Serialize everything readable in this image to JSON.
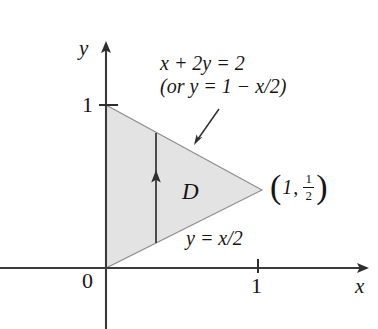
{
  "figure": {
    "type": "math-region-diagram",
    "background_color": "#ffffff",
    "axis_color": "#3a3a3a",
    "region_fill_color": "#e3e3e3",
    "region_stroke_color": "#8a8a8a",
    "text_color": "#151515"
  },
  "axes": {
    "x_label": "x",
    "y_label": "y",
    "origin_label": "0",
    "x_ticks": [
      {
        "label": "1",
        "value": 1
      }
    ],
    "y_ticks": [
      {
        "label": "1",
        "value": 1
      }
    ],
    "x_range": [
      -0.07,
      1.68
    ],
    "y_range": [
      -0.38,
      1.38
    ]
  },
  "region": {
    "name": "D",
    "label": "D",
    "vertices": [
      {
        "x": 0,
        "y": 1
      },
      {
        "x": 0,
        "y": 0
      },
      {
        "x": 1,
        "y": 0.5
      }
    ]
  },
  "annotations": {
    "upper_boundary": {
      "line1": "x + 2y = 2",
      "line2": "(or y = 1 − x/2)"
    },
    "lower_boundary": "y = x/2",
    "vertex_point": {
      "open_paren": "(",
      "x_value": "1",
      "comma": ",",
      "fraction_numerator": "1",
      "fraction_denominator": "2",
      "close_paren": ")"
    }
  },
  "icons": {
    "y_axis_arrow": "arrow-up-icon",
    "x_axis_arrow": "arrow-right-icon",
    "strip_arrow": "vertical-strip-arrow-icon",
    "pointer_arrow": "annotation-pointer-arrow-icon"
  }
}
